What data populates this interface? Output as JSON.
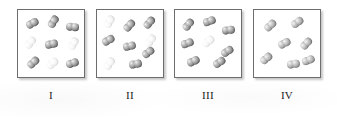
{
  "figure": {
    "background_color": "#ffffff",
    "panel_border_color": "#6d6d6d",
    "panel_background": "#ffffff",
    "dark_molecule_color": "#8a8a8a",
    "light_molecule_color": "#efefef",
    "mid_molecule_color": "#a0a0a0",
    "molecule_type": "diatomic",
    "panel_count": 4
  },
  "panels": [
    {
      "label": "I",
      "description": "Nine diatomic molecules arranged in an ordered 3 by 3 grid; a mix of dark and pale molecules",
      "molecule_count": 9,
      "dark_count": 6,
      "light_count": 3,
      "molecules": [
        {
          "x": 8,
          "y": 9,
          "rot": -28,
          "shade": "dark"
        },
        {
          "x": 29,
          "y": 7,
          "rot": -58,
          "shade": "dark"
        },
        {
          "x": 48,
          "y": 13,
          "rot": 6,
          "shade": "dark"
        },
        {
          "x": 6,
          "y": 28,
          "rot": -52,
          "shade": "light"
        },
        {
          "x": 27,
          "y": 30,
          "rot": -12,
          "shade": "dark"
        },
        {
          "x": 49,
          "y": 29,
          "rot": -62,
          "shade": "light"
        },
        {
          "x": 9,
          "y": 48,
          "rot": -42,
          "shade": "dark"
        },
        {
          "x": 28,
          "y": 49,
          "rot": -40,
          "shade": "light"
        },
        {
          "x": 48,
          "y": 49,
          "rot": -18,
          "shade": "dark"
        }
      ]
    },
    {
      "label": "II",
      "description": "Nine diatomic molecules scattered randomly; two pale molecules along the left side",
      "molecule_count": 9,
      "dark_count": 7,
      "light_count": 2,
      "molecules": [
        {
          "x": 6,
          "y": 7,
          "rot": -62,
          "shade": "light"
        },
        {
          "x": 26,
          "y": 11,
          "rot": -48,
          "shade": "dark"
        },
        {
          "x": 46,
          "y": 8,
          "rot": -50,
          "shade": "dark"
        },
        {
          "x": 5,
          "y": 26,
          "rot": -30,
          "shade": "dark"
        },
        {
          "x": 47,
          "y": 26,
          "rot": -55,
          "shade": "light"
        },
        {
          "x": 26,
          "y": 32,
          "rot": -14,
          "shade": "dark"
        },
        {
          "x": 45,
          "y": 38,
          "rot": -38,
          "shade": "dark"
        },
        {
          "x": 6,
          "y": 49,
          "rot": -55,
          "shade": "light"
        },
        {
          "x": 32,
          "y": 50,
          "rot": -10,
          "shade": "dark"
        }
      ]
    },
    {
      "label": "III",
      "description": "Eight diatomic molecules arranged around the outside with one pale molecule at the center",
      "molecule_count": 8,
      "dark_count": 7,
      "light_count": 1,
      "molecules": [
        {
          "x": 7,
          "y": 10,
          "rot": -52,
          "shade": "dark"
        },
        {
          "x": 28,
          "y": 7,
          "rot": -20,
          "shade": "dark"
        },
        {
          "x": 47,
          "y": 16,
          "rot": -8,
          "shade": "dark"
        },
        {
          "x": 6,
          "y": 29,
          "rot": -20,
          "shade": "dark"
        },
        {
          "x": 27,
          "y": 27,
          "rot": -40,
          "shade": "light"
        },
        {
          "x": 46,
          "y": 37,
          "rot": -34,
          "shade": "dark"
        },
        {
          "x": 12,
          "y": 47,
          "rot": -24,
          "shade": "dark"
        },
        {
          "x": 38,
          "y": 48,
          "rot": -34,
          "shade": "dark"
        }
      ]
    },
    {
      "label": "IV",
      "description": "Seven uniformly shaded diatomic molecules scattered randomly, no pale molecules",
      "molecule_count": 7,
      "dark_count": 7,
      "light_count": 0,
      "molecules": [
        {
          "x": 10,
          "y": 11,
          "rot": -42,
          "shade": "mid"
        },
        {
          "x": 37,
          "y": 8,
          "rot": -36,
          "shade": "mid"
        },
        {
          "x": 24,
          "y": 29,
          "rot": -28,
          "shade": "mid"
        },
        {
          "x": 46,
          "y": 29,
          "rot": -48,
          "shade": "mid"
        },
        {
          "x": 6,
          "y": 44,
          "rot": -40,
          "shade": "mid"
        },
        {
          "x": 33,
          "y": 50,
          "rot": -8,
          "shade": "mid"
        },
        {
          "x": 48,
          "y": 46,
          "rot": -22,
          "shade": "mid"
        }
      ]
    }
  ]
}
